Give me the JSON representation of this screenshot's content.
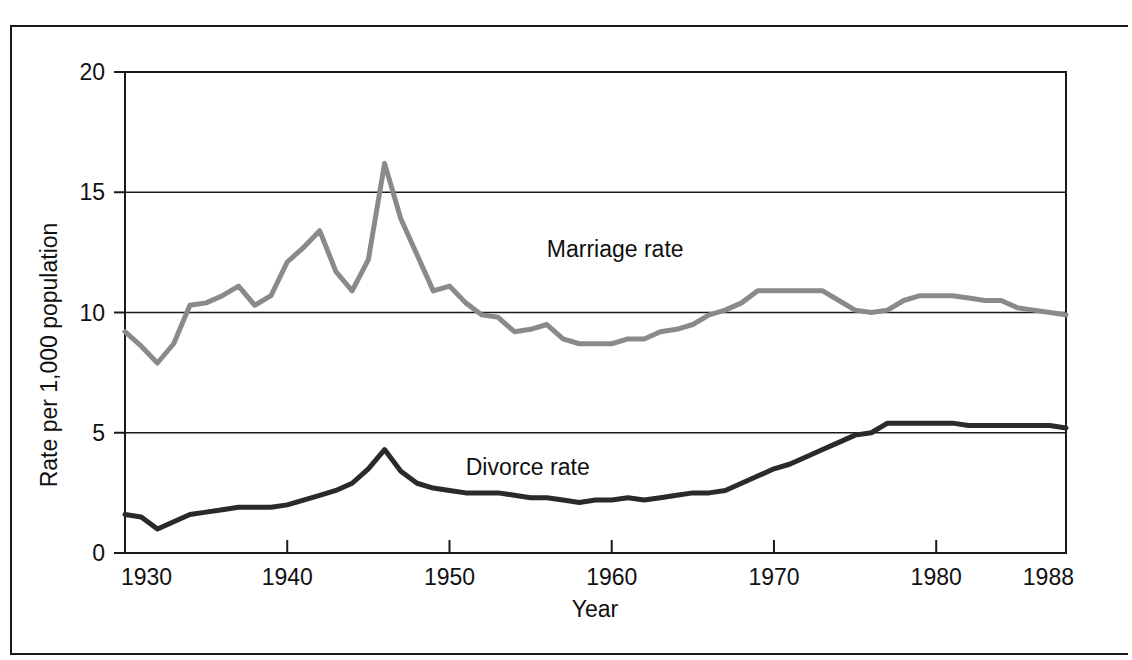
{
  "chart_data": {
    "type": "line",
    "title": "",
    "xlabel": "Year",
    "ylabel": "Rate per 1,000 population",
    "xlim": [
      1930,
      1988
    ],
    "ylim": [
      0,
      20
    ],
    "grid": true,
    "grid_axis": "y",
    "legend": "inline-labels",
    "xticks": [
      1930,
      1940,
      1950,
      1960,
      1970,
      1980,
      1988
    ],
    "xtick_labels": [
      "1930",
      "1940",
      "1950",
      "1960",
      "1970",
      "1980",
      "1988"
    ],
    "yticks": [
      0,
      5,
      10,
      15,
      20
    ],
    "ytick_labels": [
      "0",
      "5",
      "10",
      "15",
      "20"
    ],
    "x": [
      1930,
      1931,
      1932,
      1933,
      1934,
      1935,
      1936,
      1937,
      1938,
      1939,
      1940,
      1941,
      1942,
      1943,
      1944,
      1945,
      1946,
      1947,
      1948,
      1949,
      1950,
      1951,
      1952,
      1953,
      1954,
      1955,
      1956,
      1957,
      1958,
      1959,
      1960,
      1961,
      1962,
      1963,
      1964,
      1965,
      1966,
      1967,
      1968,
      1969,
      1970,
      1971,
      1972,
      1973,
      1974,
      1975,
      1976,
      1977,
      1978,
      1979,
      1980,
      1981,
      1982,
      1983,
      1984,
      1985,
      1986,
      1987,
      1988
    ],
    "series": [
      {
        "name": "Marriage rate",
        "color": "#8a8a8a",
        "label_x": 1956,
        "label_y": 12.3,
        "values": [
          9.2,
          8.6,
          7.9,
          8.7,
          10.3,
          10.4,
          10.7,
          11.1,
          10.3,
          10.7,
          12.1,
          12.7,
          13.4,
          11.7,
          10.9,
          12.2,
          16.2,
          13.9,
          12.4,
          10.9,
          11.1,
          10.4,
          9.9,
          9.8,
          9.2,
          9.3,
          9.5,
          8.9,
          8.7,
          8.7,
          8.7,
          8.9,
          8.9,
          9.2,
          9.3,
          9.5,
          9.9,
          10.1,
          10.4,
          10.9,
          10.9,
          10.9,
          10.9,
          10.9,
          10.5,
          10.1,
          10.0,
          10.1,
          10.5,
          10.7,
          10.7,
          10.7,
          10.6,
          10.5,
          10.5,
          10.2,
          10.1,
          10.0,
          9.9
        ]
      },
      {
        "name": "Divorce rate",
        "color": "#2a2a2a",
        "label_x": 1951,
        "label_y": 3.25,
        "values": [
          1.6,
          1.5,
          1.0,
          1.3,
          1.6,
          1.7,
          1.8,
          1.9,
          1.9,
          1.9,
          2.0,
          2.2,
          2.4,
          2.6,
          2.9,
          3.5,
          4.3,
          3.4,
          2.9,
          2.7,
          2.6,
          2.5,
          2.5,
          2.5,
          2.4,
          2.3,
          2.3,
          2.2,
          2.1,
          2.2,
          2.2,
          2.3,
          2.2,
          2.3,
          2.4,
          2.5,
          2.5,
          2.6,
          2.9,
          3.2,
          3.5,
          3.7,
          4.0,
          4.3,
          4.6,
          4.9,
          5.0,
          5.4,
          5.4,
          5.4,
          5.4,
          5.4,
          5.3,
          5.3,
          5.3,
          5.3,
          5.3,
          5.3,
          5.2
        ]
      }
    ]
  },
  "axes": {
    "x_title": "Year",
    "y_title": "Rate per 1,000 population"
  }
}
